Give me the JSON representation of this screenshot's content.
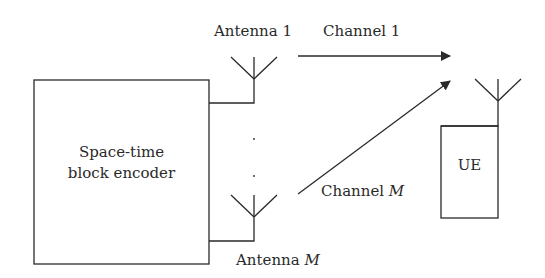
{
  "diagram": {
    "encoder": {
      "line1": "Space-time",
      "line2": "block encoder"
    },
    "antenna_1": {
      "label": "Antenna 1"
    },
    "antenna_m": {
      "label_prefix": "Antenna ",
      "label_var": "M"
    },
    "channel_1": {
      "label": "Channel 1"
    },
    "channel_m": {
      "label_prefix": "Channel ",
      "label_var": "M"
    },
    "ue": {
      "label": "UE"
    },
    "colors": {
      "stroke": "#2a2a2a",
      "background": "#ffffff"
    }
  }
}
